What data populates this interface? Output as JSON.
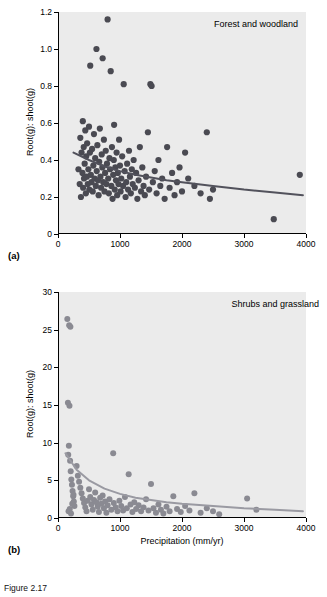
{
  "figure": {
    "caption": "Figure 2.17",
    "panel_a_letter": "(a)",
    "panel_b_letter": "(b)"
  },
  "chart_data": [
    {
      "type": "scatter",
      "id": "panel-a",
      "title": "",
      "annotation": "Forest and woodland",
      "panel_label": "(a)",
      "xlabel": "",
      "ylabel": "Root(g): shoot(g)",
      "xlim": [
        0,
        4000
      ],
      "ylim": [
        0,
        1.2
      ],
      "xticks": [
        0,
        1000,
        2000,
        3000,
        4000
      ],
      "xticklabels": [
        "0",
        "1000",
        "2000",
        "3000",
        "4000"
      ],
      "yticks": [
        0,
        0.2,
        0.4,
        0.6,
        0.8,
        1.0,
        1.2
      ],
      "yticklabels": [
        "0",
        "0.2",
        "0.4",
        "0.6",
        "0.8",
        "1.0",
        "1.2"
      ],
      "grid": false,
      "point_color": "#4a4a52",
      "line_color": "#52525c",
      "legend": "none",
      "fit_curve": {
        "x": [
          250,
          500,
          750,
          1000,
          1250,
          1500,
          1750,
          2000,
          2500,
          3000,
          3500,
          3950
        ],
        "y": [
          0.44,
          0.4,
          0.365,
          0.34,
          0.32,
          0.305,
          0.29,
          0.28,
          0.26,
          0.24,
          0.225,
          0.21
        ]
      },
      "points": [
        [
          330,
          0.35
        ],
        [
          350,
          0.27
        ],
        [
          360,
          0.52
        ],
        [
          370,
          0.2
        ],
        [
          380,
          0.44
        ],
        [
          395,
          0.33
        ],
        [
          400,
          0.61
        ],
        [
          405,
          0.25
        ],
        [
          415,
          0.47
        ],
        [
          420,
          0.3
        ],
        [
          430,
          0.38
        ],
        [
          440,
          0.56
        ],
        [
          450,
          0.22
        ],
        [
          455,
          0.42
        ],
        [
          465,
          0.31
        ],
        [
          470,
          0.49
        ],
        [
          480,
          0.27
        ],
        [
          490,
          0.35
        ],
        [
          500,
          0.58
        ],
        [
          505,
          0.24
        ],
        [
          515,
          0.44
        ],
        [
          520,
          0.91
        ],
        [
          530,
          0.32
        ],
        [
          540,
          0.28
        ],
        [
          550,
          0.46
        ],
        [
          560,
          0.23
        ],
        [
          570,
          0.37
        ],
        [
          580,
          0.54
        ],
        [
          590,
          0.3
        ],
        [
          600,
          0.41
        ],
        [
          610,
          0.26
        ],
        [
          620,
          1.0
        ],
        [
          625,
          0.34
        ],
        [
          635,
          0.48
        ],
        [
          645,
          0.29
        ],
        [
          655,
          0.21
        ],
        [
          665,
          0.39
        ],
        [
          675,
          0.57
        ],
        [
          685,
          0.31
        ],
        [
          695,
          0.25
        ],
        [
          705,
          0.43
        ],
        [
          715,
          0.36
        ],
        [
          720,
          0.95
        ],
        [
          730,
          0.28
        ],
        [
          740,
          0.51
        ],
        [
          750,
          0.23
        ],
        [
          760,
          0.33
        ],
        [
          770,
          0.45
        ],
        [
          780,
          0.27
        ],
        [
          790,
          0.38
        ],
        [
          800,
          1.16
        ],
        [
          810,
          0.3
        ],
        [
          820,
          0.22
        ],
        [
          830,
          0.41
        ],
        [
          840,
          0.35
        ],
        [
          850,
          0.88
        ],
        [
          860,
          0.26
        ],
        [
          870,
          0.47
        ],
        [
          880,
          0.19
        ],
        [
          890,
          0.32
        ],
        [
          900,
          0.4
        ],
        [
          905,
          0.59
        ],
        [
          915,
          0.24
        ],
        [
          925,
          0.36
        ],
        [
          935,
          0.29
        ],
        [
          945,
          0.44
        ],
        [
          955,
          0.21
        ],
        [
          965,
          0.33
        ],
        [
          975,
          0.27
        ],
        [
          985,
          0.51
        ],
        [
          1000,
          0.37
        ],
        [
          1010,
          0.23
        ],
        [
          1020,
          0.3
        ],
        [
          1035,
          0.42
        ],
        [
          1050,
          0.26
        ],
        [
          1060,
          0.81
        ],
        [
          1075,
          0.34
        ],
        [
          1090,
          0.2
        ],
        [
          1100,
          0.28
        ],
        [
          1115,
          0.38
        ],
        [
          1130,
          0.24
        ],
        [
          1145,
          0.45
        ],
        [
          1160,
          0.31
        ],
        [
          1175,
          0.22
        ],
        [
          1190,
          0.35
        ],
        [
          1205,
          0.27
        ],
        [
          1220,
          0.4
        ],
        [
          1240,
          0.25
        ],
        [
          1260,
          0.33
        ],
        [
          1280,
          0.19
        ],
        [
          1300,
          0.29
        ],
        [
          1320,
          0.47
        ],
        [
          1340,
          0.23
        ],
        [
          1360,
          0.36
        ],
        [
          1380,
          0.26
        ],
        [
          1400,
          0.21
        ],
        [
          1420,
          0.31
        ],
        [
          1450,
          0.55
        ],
        [
          1470,
          0.24
        ],
        [
          1490,
          0.81
        ],
        [
          1510,
          0.8
        ],
        [
          1530,
          0.28
        ],
        [
          1560,
          0.34
        ],
        [
          1590,
          0.22
        ],
        [
          1620,
          0.4
        ],
        [
          1650,
          0.26
        ],
        [
          1680,
          0.3
        ],
        [
          1720,
          0.19
        ],
        [
          1760,
          0.47
        ],
        [
          1800,
          0.25
        ],
        [
          1840,
          0.33
        ],
        [
          1880,
          0.21
        ],
        [
          1920,
          0.28
        ],
        [
          1960,
          0.36
        ],
        [
          2000,
          0.23
        ],
        [
          2050,
          0.44
        ],
        [
          2100,
          0.3
        ],
        [
          2200,
          0.26
        ],
        [
          2300,
          0.22
        ],
        [
          2400,
          0.55
        ],
        [
          2450,
          0.19
        ],
        [
          2500,
          0.24
        ],
        [
          3480,
          0.08
        ],
        [
          3900,
          0.32
        ]
      ]
    },
    {
      "type": "scatter",
      "id": "panel-b",
      "title": "",
      "annotation": "Shrubs and grassland",
      "panel_label": "(b)",
      "xlabel": "Precipitation (mm/yr)",
      "ylabel": "Root(g): shoot(g)",
      "xlim": [
        0,
        4000
      ],
      "ylim": [
        0,
        30
      ],
      "xticks": [
        0,
        1000,
        2000,
        3000,
        4000
      ],
      "xticklabels": [
        "0",
        "1000",
        "2000",
        "3000",
        "4000"
      ],
      "yticks": [
        0,
        5,
        10,
        15,
        20,
        25,
        30
      ],
      "yticklabels": [
        "0",
        "5",
        "10",
        "15",
        "20",
        "25",
        "30"
      ],
      "grid": false,
      "point_color": "#8a8a92",
      "line_color": "#9a9aa2",
      "legend": "none",
      "fit_curve": {
        "x": [
          120,
          300,
          500,
          750,
          1000,
          1250,
          1500,
          1750,
          2000,
          2500,
          3000,
          3500,
          3950
        ],
        "y": [
          8.6,
          6.4,
          5.0,
          3.9,
          3.2,
          2.7,
          2.4,
          2.1,
          1.9,
          1.6,
          1.3,
          1.1,
          0.9
        ]
      },
      "points": [
        [
          150,
          26.4
        ],
        [
          180,
          25.6
        ],
        [
          200,
          25.4
        ],
        [
          160,
          15.3
        ],
        [
          185,
          14.9
        ],
        [
          175,
          9.6
        ],
        [
          165,
          8.4
        ],
        [
          195,
          7.6
        ],
        [
          205,
          6.2
        ],
        [
          215,
          5.1
        ],
        [
          225,
          4.4
        ],
        [
          235,
          3.6
        ],
        [
          245,
          2.9
        ],
        [
          255,
          2.2
        ],
        [
          265,
          1.6
        ],
        [
          170,
          0.9
        ],
        [
          190,
          1.2
        ],
        [
          210,
          0.6
        ],
        [
          230,
          1.9
        ],
        [
          250,
          3.1
        ],
        [
          300,
          6.9
        ],
        [
          320,
          5.6
        ],
        [
          340,
          4.8
        ],
        [
          360,
          4.0
        ],
        [
          380,
          3.3
        ],
        [
          400,
          2.6
        ],
        [
          420,
          2.0
        ],
        [
          440,
          1.4
        ],
        [
          460,
          0.9
        ],
        [
          480,
          2.3
        ],
        [
          500,
          3.8
        ],
        [
          520,
          2.8
        ],
        [
          540,
          1.8
        ],
        [
          560,
          1.1
        ],
        [
          580,
          2.4
        ],
        [
          600,
          3.4
        ],
        [
          620,
          2.1
        ],
        [
          640,
          1.5
        ],
        [
          660,
          0.8
        ],
        [
          680,
          2.7
        ],
        [
          700,
          1.9
        ],
        [
          720,
          3.0
        ],
        [
          740,
          1.3
        ],
        [
          760,
          2.2
        ],
        [
          780,
          0.7
        ],
        [
          800,
          1.7
        ],
        [
          830,
          2.5
        ],
        [
          860,
          1.1
        ],
        [
          890,
          8.6
        ],
        [
          900,
          2.0
        ],
        [
          930,
          1.4
        ],
        [
          960,
          0.9
        ],
        [
          990,
          2.3
        ],
        [
          1020,
          1.6
        ],
        [
          1050,
          1.0
        ],
        [
          1080,
          2.8
        ],
        [
          1110,
          1.3
        ],
        [
          1140,
          5.8
        ],
        [
          1170,
          1.8
        ],
        [
          1200,
          0.8
        ],
        [
          1230,
          2.1
        ],
        [
          1260,
          1.2
        ],
        [
          1300,
          1.7
        ],
        [
          1340,
          0.9
        ],
        [
          1380,
          1.4
        ],
        [
          1420,
          2.5
        ],
        [
          1460,
          1.0
        ],
        [
          1500,
          4.5
        ],
        [
          1540,
          1.3
        ],
        [
          1580,
          0.7
        ],
        [
          1620,
          1.8
        ],
        [
          1660,
          1.1
        ],
        [
          1700,
          0.6
        ],
        [
          1750,
          1.5
        ],
        [
          1800,
          0.9
        ],
        [
          1860,
          2.9
        ],
        [
          1920,
          1.2
        ],
        [
          1980,
          0.8
        ],
        [
          2050,
          1.6
        ],
        [
          2120,
          1.0
        ],
        [
          2200,
          3.3
        ],
        [
          2300,
          0.7
        ],
        [
          2400,
          1.3
        ],
        [
          2500,
          0.9
        ],
        [
          2600,
          0.5
        ],
        [
          3050,
          2.6
        ],
        [
          3200,
          1.1
        ]
      ]
    }
  ]
}
